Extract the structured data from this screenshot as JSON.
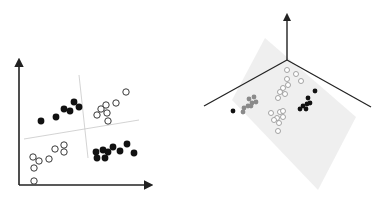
{
  "colors": {
    "background": "#ffffff",
    "axis": "#222222",
    "separator": "#c8c8c8",
    "filled_point": "#111111",
    "open_point_stroke": "#222222",
    "gray_point": "#8a8a8a",
    "plane_fill": "#ececec",
    "light_open_point_stroke": "#9a9a9a"
  },
  "panels": [
    {
      "name": "2d-feature-space",
      "description": "Four clusters in 2D separated by two crossing lines (not linearly separable)",
      "classes": [
        "filled",
        "open"
      ],
      "clusters": [
        {
          "class": "filled",
          "quadrant": "top-left",
          "count": 6
        },
        {
          "class": "open",
          "quadrant": "top-right",
          "count": 7
        },
        {
          "class": "open",
          "quadrant": "bottom-left",
          "count": 8
        },
        {
          "class": "filled",
          "quadrant": "bottom-right",
          "count": 9
        }
      ]
    },
    {
      "name": "3d-feature-space",
      "description": "Same data lifted into 3D, separated by a single plane",
      "axes": 3,
      "clusters": [
        {
          "class": "gray",
          "position": "left",
          "count": 8
        },
        {
          "class": "filled",
          "position": "far-left",
          "count": 1
        },
        {
          "class": "open",
          "position": "top-center",
          "count": 9
        },
        {
          "class": "open",
          "position": "lower-center",
          "count": 8
        },
        {
          "class": "filled",
          "position": "right",
          "count": 7
        }
      ]
    }
  ]
}
